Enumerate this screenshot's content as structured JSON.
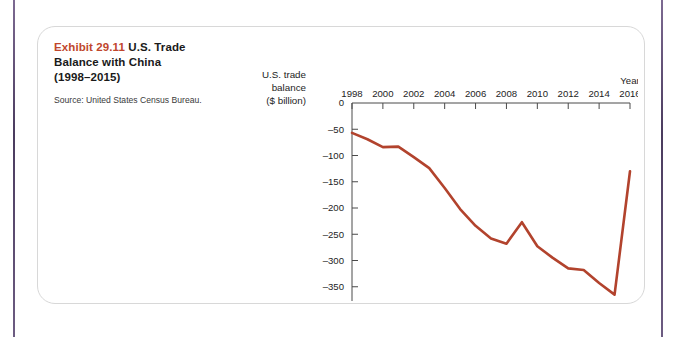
{
  "page": {
    "background_color": "#ffffff",
    "rule_color": "#4a3b5e",
    "card_border_color": "#d8d8d8"
  },
  "caption": {
    "exhibit_number": "Exhibit 29.11",
    "title": "U.S. Trade Balance with China (1998–2015)",
    "title_line1": "U.S. Trade",
    "title_line2": "Balance with China",
    "title_line3": "(1998–2015)",
    "source": "Source: United States Census Bureau.",
    "exhibit_number_color": "#c0462c"
  },
  "axis_titles": {
    "y_line1": "U.S. trade",
    "y_line2": "balance",
    "y_line3": "($ billion)",
    "x_corner_label": "Year"
  },
  "chart_data": {
    "type": "line",
    "title": "Exhibit 29.11 U.S. Trade Balance with China (1998–2015)",
    "subtitle": "Source: United States Census Bureau.",
    "xlabel": "Year",
    "ylabel": "U.S. trade balance ($ billion)",
    "series_color": "#b2432d",
    "grid": false,
    "legend": false,
    "xlim": [
      1998,
      2016
    ],
    "ylim": [
      -400,
      0
    ],
    "x_ticks": [
      1998,
      2000,
      2002,
      2004,
      2006,
      2008,
      2010,
      2012,
      2014,
      2016
    ],
    "x_tick_labels": [
      "1998",
      "2000",
      "2002",
      "2004",
      "2006",
      "2008",
      "2010",
      "2012",
      "2014",
      "2016"
    ],
    "y_ticks": [
      0,
      -50,
      -100,
      -150,
      -200,
      -250,
      -300,
      -350,
      -400
    ],
    "y_tick_labels": [
      "0",
      "–50",
      "–100",
      "–150",
      "–200",
      "–250",
      "–300",
      "–350",
      "–400"
    ],
    "x": [
      1998,
      1999,
      2000,
      2001,
      2002,
      2003,
      2004,
      2005,
      2006,
      2007,
      2008,
      2009,
      2010,
      2011,
      2012,
      2013,
      2014,
      2015,
      2016
    ],
    "values": [
      -57,
      -69,
      -84,
      -83,
      -103,
      -124,
      -162,
      -202,
      -234,
      -258,
      -268,
      -227,
      -273,
      -295,
      -315,
      -318,
      -343,
      -365,
      -130
    ],
    "series": [
      {
        "name": "U.S. trade balance with China",
        "values": [
          -57,
          -69,
          -84,
          -83,
          -103,
          -124,
          -162,
          -202,
          -234,
          -258,
          -268,
          -227,
          -273,
          -295,
          -315,
          -318,
          -343,
          -365,
          -130
        ]
      }
    ]
  }
}
